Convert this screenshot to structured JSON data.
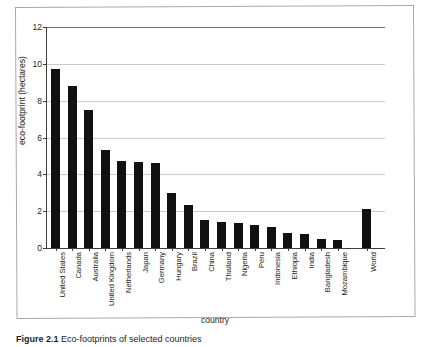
{
  "figure": {
    "caption_label": "Figure 2.1",
    "caption_text": "Eco-footprints of selected countries"
  },
  "chart_data": {
    "type": "bar",
    "title": "",
    "xlabel": "country",
    "ylabel": "eco-footprint (hectares)",
    "ylim": [
      0,
      12
    ],
    "yticks": [
      0,
      2,
      4,
      6,
      8,
      10,
      12
    ],
    "ytick_labels": [
      "0",
      "2",
      "4",
      "6",
      "8",
      "10",
      "12"
    ],
    "grid": true,
    "grid_axis": "y",
    "legend": "none",
    "bar_color": "#111111",
    "categories": [
      "United States",
      "Canada",
      "Australia",
      "United Kingdom",
      "Netherlands",
      "Japan",
      "Germany",
      "Hungary",
      "Brazil",
      "China",
      "Thailand",
      "Nigeria",
      "Peru",
      "Indonesia",
      "Ethiopia",
      "India",
      "Bangladesh",
      "Mozambique",
      "World"
    ],
    "values": [
      9.7,
      8.8,
      7.5,
      5.3,
      4.7,
      4.65,
      4.6,
      3.0,
      2.35,
      1.5,
      1.4,
      1.35,
      1.25,
      1.15,
      0.8,
      0.75,
      0.5,
      0.45,
      2.1
    ]
  }
}
